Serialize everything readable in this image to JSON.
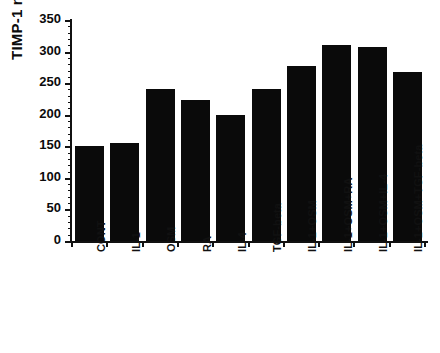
{
  "chart_data": {
    "type": "bar",
    "title": "",
    "xlabel": "",
    "ylabel": "TIMP-1 ng/ml",
    "ylim": [
      0,
      350
    ],
    "yticks": [
      0,
      50,
      100,
      150,
      200,
      250,
      300,
      350
    ],
    "ytick_labels": [
      "0",
      "50",
      "100",
      "150",
      "200",
      "250",
      "300",
      "350"
    ],
    "minor_ticks": true,
    "grid": false,
    "legend": null,
    "bar_color": "#0a0a0a",
    "axis_color": "#111111",
    "categories": [
      "CONT",
      "IL-1",
      "OSM",
      "RA",
      "IL-4",
      "TGF-beta",
      "IL-1+OSM",
      "IL-1+OSM+RA",
      "IL-1+OSM+IL-4",
      "IL-1+OSM+TGF-beta"
    ],
    "values": [
      150,
      155,
      240,
      223,
      200,
      240,
      277,
      310,
      308,
      267
    ]
  }
}
